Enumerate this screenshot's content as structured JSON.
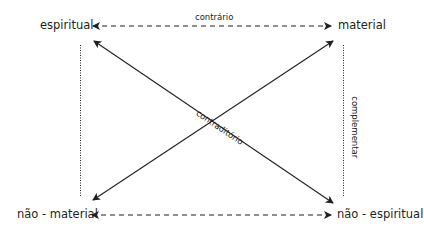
{
  "diagram": {
    "type": "semiotic-square",
    "nodes": {
      "top_left": "espiritual",
      "top_right": "material",
      "bottom_left": "não - material",
      "bottom_right": "não - espiritual"
    },
    "relations": {
      "contrary": "contrário",
      "contradictory": "contraditório",
      "complementary": "complementar"
    },
    "edges": [
      {
        "from": "espiritual",
        "to": "material",
        "style": "dashed",
        "arrows": "both",
        "label": "contrário"
      },
      {
        "from": "não - material",
        "to": "não - espiritual",
        "style": "dashed",
        "arrows": "both"
      },
      {
        "from": "espiritual",
        "to": "não - espiritual",
        "style": "solid",
        "arrows": "both",
        "label": "contraditório"
      },
      {
        "from": "material",
        "to": "não - material",
        "style": "solid",
        "arrows": "both"
      },
      {
        "from": "espiritual",
        "to": "não - material",
        "style": "dotted",
        "arrows": "none"
      },
      {
        "from": "material",
        "to": "não - espiritual",
        "style": "dotted",
        "arrows": "none",
        "label": "complementar"
      }
    ],
    "colors": {
      "line": "#231f20",
      "background": "#ffffff"
    }
  }
}
